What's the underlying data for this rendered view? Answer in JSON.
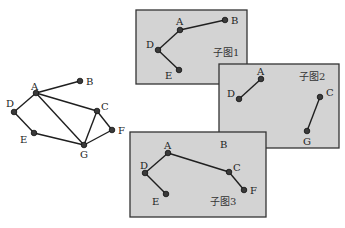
{
  "colors": {
    "panel_fill": "#d3d3d3",
    "panel_border": "#333333",
    "node": "#3a3a3a",
    "edge": "#1f1f1f"
  },
  "main_graph": {
    "nodes": [
      {
        "id": "A",
        "label": "A",
        "x": 36,
        "y": 93,
        "lx": 31,
        "ly": 90
      },
      {
        "id": "B",
        "label": "B",
        "x": 80,
        "y": 81,
        "lx": 86,
        "ly": 85
      },
      {
        "id": "C",
        "label": "C",
        "x": 97,
        "y": 111,
        "lx": 101,
        "ly": 110
      },
      {
        "id": "D",
        "label": "D",
        "x": 14,
        "y": 112,
        "lx": 6,
        "ly": 107
      },
      {
        "id": "E",
        "label": "E",
        "x": 34,
        "y": 133,
        "lx": 20,
        "ly": 143
      },
      {
        "id": "F",
        "label": "F",
        "x": 112,
        "y": 130,
        "lx": 118,
        "ly": 134
      },
      {
        "id": "G",
        "label": "G",
        "x": 84,
        "y": 145,
        "lx": 80,
        "ly": 158
      }
    ],
    "edges": [
      [
        "A",
        "B"
      ],
      [
        "A",
        "D"
      ],
      [
        "A",
        "C"
      ],
      [
        "A",
        "G"
      ],
      [
        "D",
        "E"
      ],
      [
        "E",
        "G"
      ],
      [
        "C",
        "G"
      ],
      [
        "C",
        "F"
      ],
      [
        "F",
        "G"
      ]
    ]
  },
  "subgraphs": [
    {
      "caption": "子图1",
      "rect": {
        "x": 136,
        "y": 10,
        "w": 111,
        "h": 74
      },
      "caption_pos": {
        "x": 213,
        "y": 56
      },
      "nodes": [
        {
          "id": "A",
          "label": "A",
          "x": 180,
          "y": 30,
          "lx": 176,
          "ly": 25
        },
        {
          "id": "B",
          "label": "B",
          "x": 225,
          "y": 20,
          "lx": 231,
          "ly": 24
        },
        {
          "id": "D",
          "label": "D",
          "x": 158,
          "y": 50,
          "lx": 146,
          "ly": 48
        },
        {
          "id": "E",
          "label": "E",
          "x": 179,
          "y": 70,
          "lx": 165,
          "ly": 79
        }
      ],
      "edges": [
        [
          "A",
          "B"
        ],
        [
          "A",
          "D"
        ],
        [
          "D",
          "E"
        ]
      ]
    },
    {
      "caption": "子图2",
      "rect": {
        "x": 219,
        "y": 64,
        "w": 120,
        "h": 84
      },
      "caption_pos": {
        "x": 299,
        "y": 80
      },
      "nodes": [
        {
          "id": "A",
          "label": "A",
          "x": 261,
          "y": 79,
          "lx": 257,
          "ly": 75
        },
        {
          "id": "D",
          "label": "D",
          "x": 239,
          "y": 99,
          "lx": 227,
          "ly": 97
        },
        {
          "id": "C",
          "label": "C",
          "x": 320,
          "y": 97,
          "lx": 326,
          "ly": 96
        },
        {
          "id": "G",
          "label": "G",
          "x": 307,
          "y": 131,
          "lx": 303,
          "ly": 145
        }
      ],
      "edges": [
        [
          "A",
          "D"
        ],
        [
          "C",
          "G"
        ]
      ]
    },
    {
      "caption": "子图3",
      "rect": {
        "x": 130,
        "y": 132,
        "w": 136,
        "h": 85
      },
      "caption_pos": {
        "x": 210,
        "y": 205
      },
      "nodes": [
        {
          "id": "A",
          "label": "A",
          "x": 168,
          "y": 153,
          "lx": 164,
          "ly": 149
        },
        {
          "id": "B",
          "label": "B",
          "x": null,
          "y": null,
          "lx": 220,
          "ly": 148
        },
        {
          "id": "D",
          "label": "D",
          "x": 145,
          "y": 173,
          "lx": 140,
          "ly": 169
        },
        {
          "id": "E",
          "label": "E",
          "x": 166,
          "y": 194,
          "lx": 152,
          "ly": 205
        },
        {
          "id": "C",
          "label": "C",
          "x": 229,
          "y": 172,
          "lx": 233,
          "ly": 171
        },
        {
          "id": "F",
          "label": "F",
          "x": 244,
          "y": 190,
          "lx": 250,
          "ly": 194
        }
      ],
      "edges": [
        [
          "A",
          "D"
        ],
        [
          "D",
          "E"
        ],
        [
          "A",
          "C"
        ],
        [
          "C",
          "F"
        ]
      ]
    }
  ]
}
